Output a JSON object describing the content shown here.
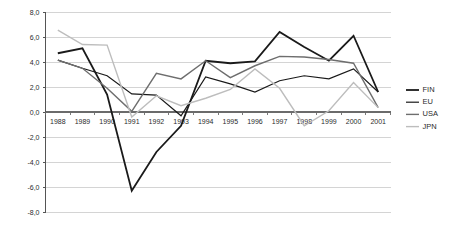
{
  "chart_data": {
    "type": "line",
    "title": "",
    "subtitle": "",
    "xlabel": "",
    "ylabel": "",
    "categories": [
      "1988",
      "1989",
      "1990",
      "1991",
      "1992",
      "1993",
      "1994",
      "1995",
      "1996",
      "1997",
      "1998",
      "1999",
      "2000",
      "2001"
    ],
    "x_tick_labels": [
      "1988",
      "1989",
      "1990",
      "1991",
      "1992",
      "1993",
      "1994",
      "1995",
      "1996",
      "1997",
      "1998",
      "1999",
      "2000",
      "2001"
    ],
    "y_tick_labels": [
      "8,0",
      "6,0",
      "4,0",
      "2,0",
      "0,0",
      "-2,0",
      "-4,0",
      "-6,0",
      "-8,0"
    ],
    "y_ticks": [
      8.0,
      6.0,
      4.0,
      2.0,
      0.0,
      -2.0,
      -4.0,
      -6.0,
      -8.0
    ],
    "ylim": [
      -8.0,
      8.0
    ],
    "grid": true,
    "grid_axis": "y",
    "legend_position": "right",
    "series": [
      {
        "name": "FIN",
        "color": "#1a1a1a",
        "width": 1.8,
        "values": [
          4.7,
          5.1,
          1.4,
          -6.3,
          -3.2,
          -1.1,
          4.1,
          3.9,
          4.05,
          6.4,
          5.2,
          4.1,
          6.1,
          1.6
        ]
      },
      {
        "name": "EU",
        "color": "#1a1a1a",
        "width": 1.2,
        "values": [
          4.15,
          3.5,
          2.9,
          1.45,
          1.35,
          -0.3,
          2.8,
          2.25,
          1.6,
          2.5,
          2.9,
          2.65,
          3.45,
          1.6
        ]
      },
      {
        "name": "USA",
        "color": "#6e6e6e",
        "width": 1.4,
        "values": [
          4.15,
          3.5,
          1.9,
          0.05,
          3.1,
          2.65,
          4.1,
          2.75,
          3.7,
          4.45,
          4.4,
          4.2,
          3.9,
          0.35
        ]
      },
      {
        "name": "JPN",
        "color": "#bdbdbd",
        "width": 1.4,
        "values": [
          6.55,
          5.4,
          5.35,
          -0.4,
          1.3,
          0.5,
          1.1,
          1.8,
          3.45,
          1.9,
          -1.1,
          0.1,
          2.35,
          0.35
        ]
      }
    ]
  },
  "legend": {
    "items": [
      {
        "label": "FIN"
      },
      {
        "label": "EU"
      },
      {
        "label": "USA"
      },
      {
        "label": "JPN"
      }
    ]
  }
}
